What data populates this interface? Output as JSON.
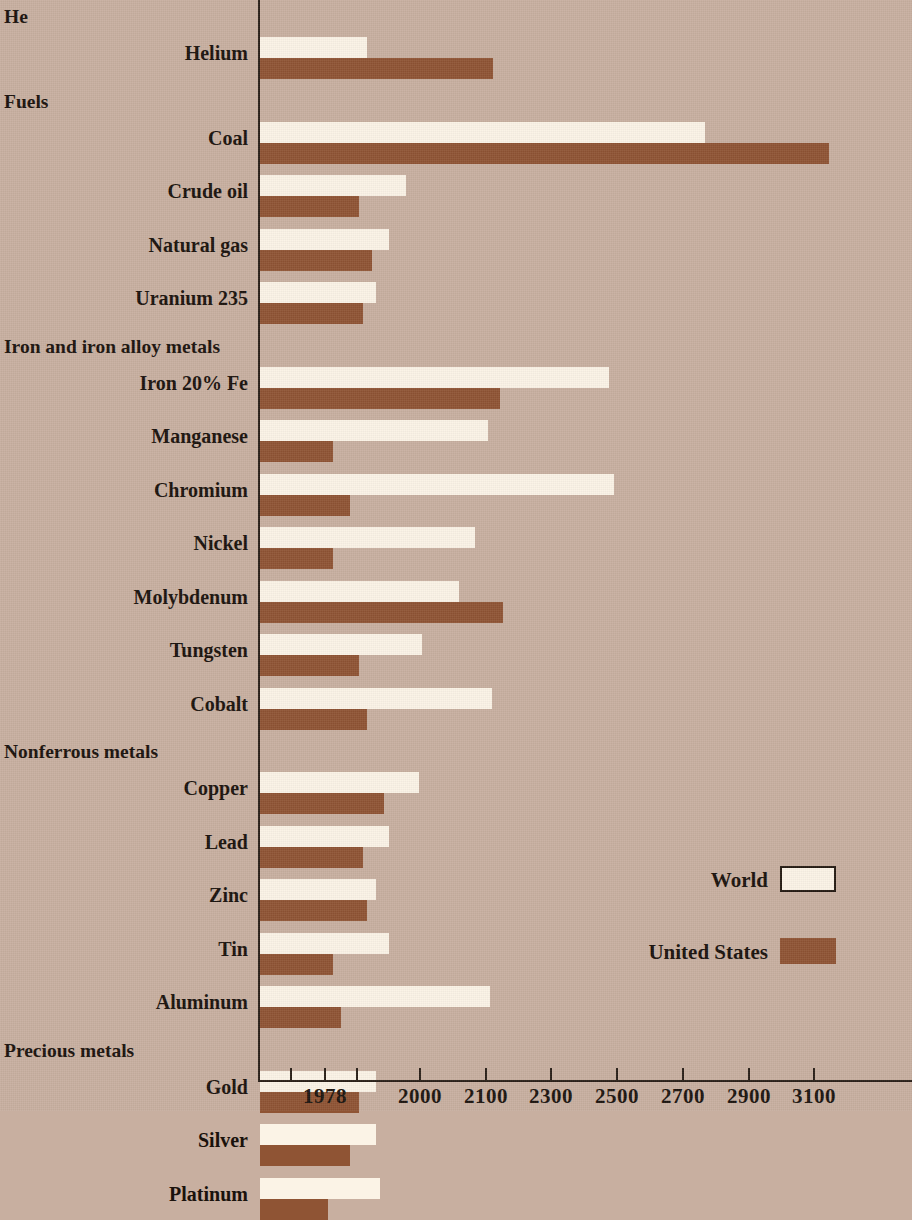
{
  "colors": {
    "background": "#c8afa0",
    "world_bar": "#fbf3e6",
    "us_bar": "#8f5434",
    "axis": "#2a2018",
    "text": "#1a120c"
  },
  "legend": {
    "position": "bottom-right",
    "entries": [
      {
        "label": "World",
        "color": "#fbf3e6"
      },
      {
        "label": "United States",
        "color": "#8f5434"
      }
    ]
  },
  "axis": {
    "tick_labels": [
      "1978",
      "2000",
      "2100",
      "2300",
      "2500",
      "2700",
      "2900",
      "3100"
    ],
    "unlabeled_tick_count": 1,
    "start_year": 1978
  },
  "groups": [
    {
      "title": "He",
      "items": [
        "Helium"
      ]
    },
    {
      "title": "Fuels",
      "items": [
        "Coal",
        "Crude oil",
        "Natural gas",
        "Uranium 235"
      ]
    },
    {
      "title": "Iron and iron alloy metals",
      "items": [
        "Iron 20% Fe",
        "Manganese",
        "Chromium",
        "Nickel",
        "Molybdenum",
        "Tungsten",
        "Cobalt"
      ]
    },
    {
      "title": "Nonferrous metals",
      "items": [
        "Copper",
        "Lead",
        "Zinc",
        "Tin",
        "Aluminum"
      ]
    },
    {
      "title": "Precious metals",
      "items": [
        "Gold",
        "Silver",
        "Platinum"
      ]
    }
  ],
  "chart_data": {
    "type": "bar",
    "orientation": "horizontal",
    "title": "",
    "xlabel": "",
    "ylabel": "",
    "xlim": [
      1978,
      3150
    ],
    "grid": false,
    "note": "Years of depletion of world and United States reserves; bars extend from 1978 to the exhaustion year.",
    "categories": [
      "Helium",
      "Coal",
      "Crude oil",
      "Natural gas",
      "Uranium 235",
      "Iron 20% Fe",
      "Manganese",
      "Chromium",
      "Nickel",
      "Molybdenum",
      "Tungsten",
      "Cobalt",
      "Copper",
      "Lead",
      "Zinc",
      "Tin",
      "Aluminum",
      "Gold",
      "Silver",
      "Platinum"
    ],
    "series": [
      {
        "name": "World",
        "color": "#fbf3e6",
        "values": [
          1988,
          2770,
          1997,
          1993,
          1990,
          2480,
          2110,
          2495,
          2085,
          2060,
          2005,
          2120,
          2000,
          1993,
          1990,
          1993,
          2115,
          1990,
          1990,
          1991
        ]
      },
      {
        "name": "United States",
        "color": "#8f5434",
        "values": [
          2125,
          3150,
          1986,
          1989,
          1987,
          2145,
          1980,
          1984,
          1980,
          2155,
          1986,
          1988,
          1992,
          1987,
          1988,
          1980,
          1982,
          1986,
          1984,
          1979
        ]
      }
    ]
  }
}
